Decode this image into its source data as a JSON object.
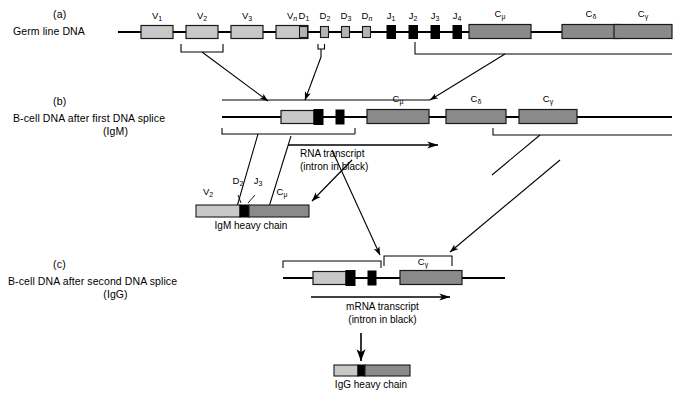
{
  "figure": {
    "background": "#ffffff",
    "line_color": "#000000",
    "colors": {
      "v_segment": "#c8c8c8",
      "d_segment": "#b4b4b4",
      "j_segment": "#000000",
      "c_segment": "#8a8a8a",
      "intron": "#000000",
      "bracket": "#000000"
    }
  },
  "panels": [
    {
      "letter": "(a)",
      "label": "Germ line DNA",
      "sublabel": "",
      "segments": {
        "v": [
          "V",
          "V",
          "V",
          "V"
        ],
        "v_subs": [
          "1",
          "2",
          "3",
          "n"
        ],
        "d": [
          "D",
          "D",
          "D",
          "D"
        ],
        "d_subs": [
          "1",
          "2",
          "3",
          "n"
        ],
        "j": [
          "J",
          "J",
          "J",
          "J"
        ],
        "j_subs": [
          "1",
          "2",
          "3",
          "4"
        ],
        "c": [
          "C",
          "C",
          "C"
        ],
        "c_subs": [
          "μ",
          "δ",
          "γ"
        ]
      }
    },
    {
      "letter": "(b)",
      "label": "B-cell DNA after first DNA splice",
      "sublabel": "(IgM)",
      "segments": {
        "c": [
          "C",
          "C",
          "C"
        ],
        "c_subs": [
          "μ",
          "δ",
          "γ"
        ]
      },
      "transcript": {
        "line1": "RNA transcript",
        "line2": "(intron in black)"
      }
    },
    {
      "letter": "(c)",
      "label": "B-cell DNA after second DNA splice",
      "sublabel": "(IgG)",
      "segments": {
        "c": [
          "C"
        ],
        "c_subs": [
          "γ"
        ]
      },
      "transcript": {
        "line1": "mRNA transcript",
        "line2": "(intron in black)"
      }
    }
  ],
  "igm_chain": {
    "label": "IgM heavy chain",
    "part_labels": {
      "v": "V",
      "v_sub": "2",
      "d": "D",
      "d_sub": "2",
      "j": "J",
      "j_sub": "3",
      "c": "C",
      "c_sub": "μ"
    }
  },
  "igg_chain": {
    "label": "IgG heavy chain"
  }
}
